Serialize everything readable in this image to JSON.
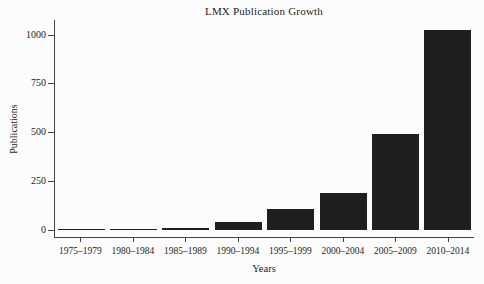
{
  "chart_data": {
    "type": "bar",
    "title": "LMX Publication Growth",
    "xlabel": "Years",
    "ylabel": "Publications",
    "categories": [
      "1975–1979",
      "1980–1984",
      "1985–1989",
      "1990–1994",
      "1995–1999",
      "2000–2004",
      "2005–2009",
      "2010–2014"
    ],
    "values": [
      3,
      6,
      8,
      42,
      108,
      190,
      490,
      1025
    ],
    "yticks": [
      0,
      250,
      500,
      750,
      1000
    ],
    "ylim": [
      0,
      1071
    ],
    "grid": false,
    "legend": "none",
    "colors": {
      "bar": "#1f1f1f",
      "axis": "#444444",
      "text": "#1c1c1c",
      "background": "#fcfcfc"
    }
  }
}
